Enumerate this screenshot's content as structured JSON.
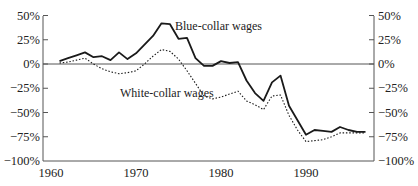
{
  "chart_data": {
    "type": "line",
    "title": "",
    "xlabel": "",
    "ylabel": "",
    "xlim": [
      1960,
      1998
    ],
    "ylim": [
      -100,
      50
    ],
    "grid": false,
    "legend": "inline labels",
    "x_ticks": [
      "1960",
      "1970",
      "1980",
      "1990"
    ],
    "y_ticks_left": [
      "50%",
      "25%",
      "0%",
      "−25%",
      "−50%",
      "−75%",
      "−100%"
    ],
    "y_ticks_right": [
      "50%",
      "25%",
      "0%",
      "−25%",
      "−50%",
      "−75%",
      "−100%"
    ],
    "x": [
      1961,
      1962,
      1963,
      1964,
      1965,
      1966,
      1967,
      1968,
      1969,
      1970,
      1971,
      1972,
      1973,
      1974,
      1975,
      1976,
      1977,
      1978,
      1979,
      1980,
      1981,
      1982,
      1983,
      1984,
      1985,
      1986,
      1987,
      1988,
      1989,
      1990,
      1991,
      1992,
      1993,
      1994,
      1995,
      1996,
      1997
    ],
    "series": [
      {
        "name": "Blue-collar wages",
        "style": "solid",
        "values": [
          3,
          6,
          9,
          12,
          7,
          8,
          4,
          12,
          5,
          11,
          20,
          29,
          42,
          41,
          26,
          27,
          6,
          -2,
          -2,
          3,
          1,
          2,
          -17,
          -30,
          -38,
          -19,
          -12,
          -43,
          -58,
          -73,
          -68,
          -69,
          -70,
          -65,
          -68,
          -70,
          -70
        ]
      },
      {
        "name": "White-collar wages",
        "style": "dotted",
        "values": [
          1,
          2,
          4,
          6,
          0,
          -5,
          -8,
          -10,
          -9,
          -7,
          0,
          8,
          15,
          13,
          5,
          -7,
          -20,
          -33,
          -36,
          -34,
          -31,
          -28,
          -38,
          -42,
          -47,
          -33,
          -32,
          -53,
          -68,
          -80,
          -79,
          -78,
          -75,
          -71,
          -71,
          -71,
          -71
        ]
      }
    ],
    "annotations": [
      {
        "text": "Blue-collar wages",
        "x": 1975,
        "y": 38
      },
      {
        "text": "White-collar wages",
        "x": 1968,
        "y": -30
      }
    ]
  },
  "labels": {
    "blue": "Blue-collar wages",
    "white": "White-collar wages"
  },
  "colors": {
    "line": "#1a1a1a",
    "axis": "#555555"
  }
}
